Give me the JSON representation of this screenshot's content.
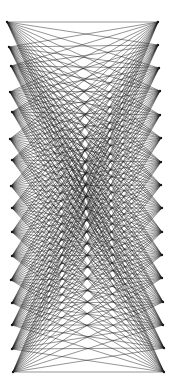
{
  "diagram": {
    "type": "complete-bipartite-graph",
    "width": 178,
    "height": 391,
    "background": "#ffffff",
    "edge_color": "#1a1a1a",
    "edge_width": 0.55,
    "edge_opacity": 0.85,
    "left_nodes": [
      {
        "x": 7,
        "y": 22
      },
      {
        "x": 9,
        "y": 47
      },
      {
        "x": 11,
        "y": 66
      },
      {
        "x": 10,
        "y": 92
      },
      {
        "x": 12,
        "y": 112
      },
      {
        "x": 10,
        "y": 139
      },
      {
        "x": 12,
        "y": 160
      },
      {
        "x": 11,
        "y": 186
      },
      {
        "x": 12,
        "y": 208
      },
      {
        "x": 12,
        "y": 232
      },
      {
        "x": 12,
        "y": 256
      },
      {
        "x": 11,
        "y": 280
      },
      {
        "x": 12,
        "y": 303
      },
      {
        "x": 12,
        "y": 325
      },
      {
        "x": 12,
        "y": 349
      },
      {
        "x": 13,
        "y": 372
      }
    ],
    "right_nodes": [
      {
        "x": 158,
        "y": 22
      },
      {
        "x": 158,
        "y": 45
      },
      {
        "x": 159,
        "y": 68
      },
      {
        "x": 160,
        "y": 91
      },
      {
        "x": 160,
        "y": 115
      },
      {
        "x": 161,
        "y": 138
      },
      {
        "x": 161,
        "y": 162
      },
      {
        "x": 161,
        "y": 185
      },
      {
        "x": 162,
        "y": 208
      },
      {
        "x": 162,
        "y": 232
      },
      {
        "x": 162,
        "y": 255
      },
      {
        "x": 162,
        "y": 278
      },
      {
        "x": 163,
        "y": 302
      },
      {
        "x": 163,
        "y": 325
      },
      {
        "x": 164,
        "y": 348
      },
      {
        "x": 164,
        "y": 372
      }
    ]
  }
}
